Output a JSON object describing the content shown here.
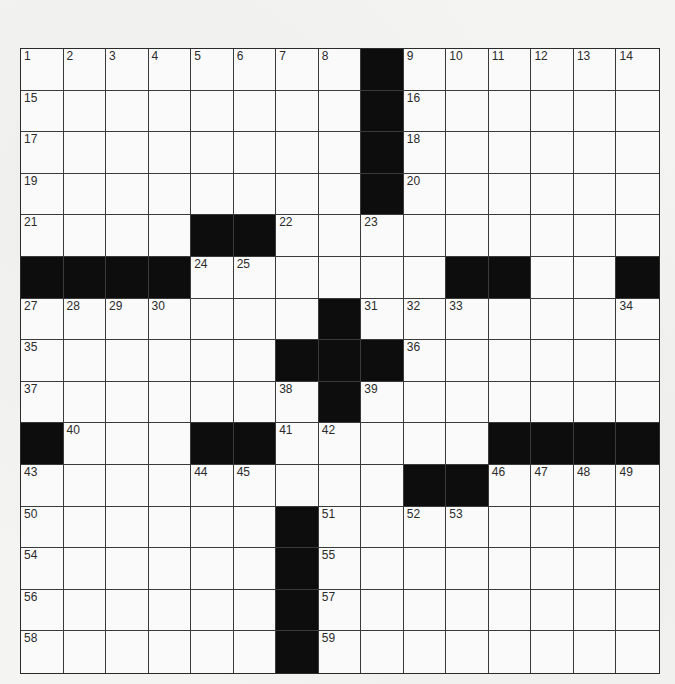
{
  "puzzle": {
    "rows": 15,
    "cols": 15,
    "colors": {
      "block": "#0d0d0d",
      "cell": "#f8f8f7",
      "line": "#3a3a3a"
    },
    "grid": [
      "........#......",
      "........#......",
      "........#......",
      "........#......",
      "....##.........",
      "####......##..#",
      ".......#.......",
      "......###......",
      ".......#.......",
      "#...##.....####",
      ".........##....",
      "......#........",
      "......#........",
      "......#........",
      "......#........"
    ],
    "numbers": [
      {
        "r": 0,
        "c": 0,
        "n": "1"
      },
      {
        "r": 0,
        "c": 1,
        "n": "2"
      },
      {
        "r": 0,
        "c": 2,
        "n": "3"
      },
      {
        "r": 0,
        "c": 3,
        "n": "4"
      },
      {
        "r": 0,
        "c": 4,
        "n": "5"
      },
      {
        "r": 0,
        "c": 5,
        "n": "6"
      },
      {
        "r": 0,
        "c": 6,
        "n": "7"
      },
      {
        "r": 0,
        "c": 7,
        "n": "8"
      },
      {
        "r": 0,
        "c": 9,
        "n": "9"
      },
      {
        "r": 0,
        "c": 10,
        "n": "10"
      },
      {
        "r": 0,
        "c": 11,
        "n": "11"
      },
      {
        "r": 0,
        "c": 12,
        "n": "12"
      },
      {
        "r": 0,
        "c": 13,
        "n": "13"
      },
      {
        "r": 0,
        "c": 14,
        "n": "14"
      },
      {
        "r": 1,
        "c": 0,
        "n": "15"
      },
      {
        "r": 1,
        "c": 9,
        "n": "16"
      },
      {
        "r": 2,
        "c": 0,
        "n": "17"
      },
      {
        "r": 2,
        "c": 9,
        "n": "18"
      },
      {
        "r": 3,
        "c": 0,
        "n": "19"
      },
      {
        "r": 3,
        "c": 9,
        "n": "20"
      },
      {
        "r": 4,
        "c": 0,
        "n": "21"
      },
      {
        "r": 4,
        "c": 6,
        "n": "22"
      },
      {
        "r": 4,
        "c": 8,
        "n": "23"
      },
      {
        "r": 5,
        "c": 4,
        "n": "24"
      },
      {
        "r": 5,
        "c": 5,
        "n": "25"
      },
      {
        "r": 5,
        "c": 11,
        "n": "26"
      },
      {
        "r": 6,
        "c": 0,
        "n": "27"
      },
      {
        "r": 6,
        "c": 1,
        "n": "28"
      },
      {
        "r": 6,
        "c": 2,
        "n": "29"
      },
      {
        "r": 6,
        "c": 3,
        "n": "30"
      },
      {
        "r": 6,
        "c": 8,
        "n": "31"
      },
      {
        "r": 6,
        "c": 9,
        "n": "32"
      },
      {
        "r": 6,
        "c": 10,
        "n": "33"
      },
      {
        "r": 6,
        "c": 14,
        "n": "34"
      },
      {
        "r": 7,
        "c": 0,
        "n": "35"
      },
      {
        "r": 7,
        "c": 9,
        "n": "36"
      },
      {
        "r": 8,
        "c": 0,
        "n": "37"
      },
      {
        "r": 8,
        "c": 6,
        "n": "38"
      },
      {
        "r": 8,
        "c": 8,
        "n": "39"
      },
      {
        "r": 9,
        "c": 1,
        "n": "40"
      },
      {
        "r": 9,
        "c": 6,
        "n": "41"
      },
      {
        "r": 9,
        "c": 7,
        "n": "42"
      },
      {
        "r": 10,
        "c": 0,
        "n": "43"
      },
      {
        "r": 10,
        "c": 4,
        "n": "44"
      },
      {
        "r": 10,
        "c": 5,
        "n": "45"
      },
      {
        "r": 10,
        "c": 11,
        "n": "46"
      },
      {
        "r": 10,
        "c": 12,
        "n": "47"
      },
      {
        "r": 10,
        "c": 13,
        "n": "48"
      },
      {
        "r": 10,
        "c": 14,
        "n": "49"
      },
      {
        "r": 11,
        "c": 0,
        "n": "50"
      },
      {
        "r": 11,
        "c": 7,
        "n": "51"
      },
      {
        "r": 11,
        "c": 9,
        "n": "52"
      },
      {
        "r": 11,
        "c": 10,
        "n": "53"
      },
      {
        "r": 12,
        "c": 0,
        "n": "54"
      },
      {
        "r": 12,
        "c": 7,
        "n": "55"
      },
      {
        "r": 13,
        "c": 0,
        "n": "56"
      },
      {
        "r": 13,
        "c": 7,
        "n": "57"
      },
      {
        "r": 14,
        "c": 0,
        "n": "58"
      },
      {
        "r": 14,
        "c": 7,
        "n": "59"
      }
    ]
  }
}
